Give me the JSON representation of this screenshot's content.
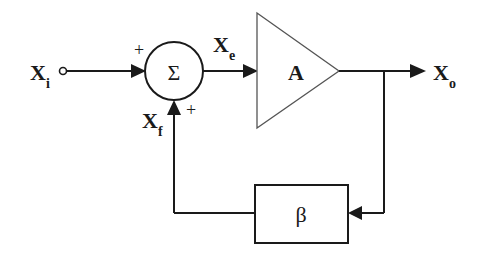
{
  "diagram": {
    "type": "feedback-block-diagram",
    "input": {
      "symbol": "X",
      "subscript": "i"
    },
    "error": {
      "symbol": "X",
      "subscript": "e"
    },
    "feedback": {
      "symbol": "X",
      "subscript": "f"
    },
    "output": {
      "symbol": "X",
      "subscript": "o"
    },
    "summer": {
      "symbol": "Σ",
      "input_sign": "+",
      "feedback_sign": "+"
    },
    "amplifier": {
      "label": "A"
    },
    "feedback_network": {
      "label": "β"
    },
    "colors": {
      "line": "#1a1a1a",
      "background": "#ffffff",
      "amp_outline": "#555555"
    }
  }
}
